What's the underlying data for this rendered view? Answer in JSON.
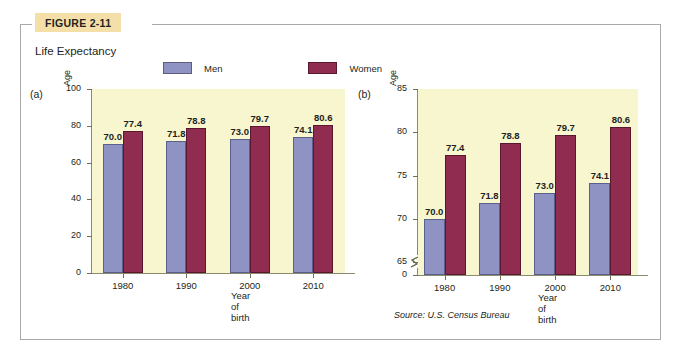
{
  "figure": {
    "tab_label": "FIGURE 2-11",
    "title": "Life Expectancy",
    "source": "Source: U.S. Census Bureau",
    "tab_color": "#f5dfa8",
    "plot_background": "#f8f6cf",
    "men_color": "#8e93c4",
    "women_color": "#8f2c4f"
  },
  "legend": {
    "men_label": "Men",
    "women_label": "Women"
  },
  "panels": {
    "a": {
      "letter": "(a)",
      "y_axis_name": "Age",
      "x_axis_title": "Year of birth"
    },
    "b": {
      "letter": "(b)",
      "y_axis_name": "Age",
      "x_axis_title": "Year of birth"
    }
  },
  "chart_data": [
    {
      "type": "bar",
      "panel": "(a)",
      "title": "Life Expectancy",
      "xlabel": "Year of birth",
      "ylabel": "Age",
      "categories": [
        "1980",
        "1990",
        "2000",
        "2010"
      ],
      "series": [
        {
          "name": "Men",
          "values": [
            70.0,
            71.8,
            73.0,
            74.1
          ],
          "color": "#8e93c4"
        },
        {
          "name": "Women",
          "values": [
            77.4,
            78.8,
            79.7,
            80.6
          ],
          "color": "#8f2c4f"
        }
      ],
      "data_labels": [
        [
          "70.0",
          "77.4"
        ],
        [
          "71.8",
          "78.8"
        ],
        [
          "73.0",
          "79.7"
        ],
        [
          "74.1",
          "80.6"
        ]
      ],
      "ylim": [
        0,
        100
      ],
      "yticks": [
        "0",
        "20",
        "40",
        "60",
        "80",
        "100"
      ],
      "grid": false,
      "axis_break": false,
      "legend_position": "top"
    },
    {
      "type": "bar",
      "panel": "(b)",
      "title": "Life Expectancy",
      "xlabel": "Year of birth",
      "ylabel": "Age",
      "categories": [
        "1980",
        "1990",
        "2000",
        "2010"
      ],
      "series": [
        {
          "name": "Men",
          "values": [
            70.0,
            71.8,
            73.0,
            74.1
          ],
          "color": "#8e93c4"
        },
        {
          "name": "Women",
          "values": [
            77.4,
            78.8,
            79.7,
            80.6
          ],
          "color": "#8f2c4f"
        }
      ],
      "data_labels": [
        [
          "70.0",
          "77.4"
        ],
        [
          "71.8",
          "78.8"
        ],
        [
          "73.0",
          "79.7"
        ],
        [
          "74.1",
          "80.6"
        ]
      ],
      "ylim": [
        63.5,
        85
      ],
      "yticks": [
        "0",
        "65",
        "70",
        "75",
        "80",
        "85"
      ],
      "grid": false,
      "axis_break": true,
      "legend_position": "top"
    }
  ]
}
